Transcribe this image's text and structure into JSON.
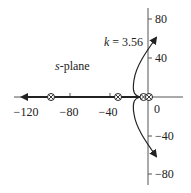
{
  "diagram": {
    "type": "root-locus",
    "plane_label_italic": "s",
    "plane_label_rest": "-plane",
    "gain_annotation_var": "k",
    "gain_annotation_rest": " = 3.56",
    "x_ticks": [
      {
        "value": -120,
        "label": "−120"
      },
      {
        "value": -80,
        "label": "−80"
      },
      {
        "value": -40,
        "label": "−40"
      },
      {
        "value": 0,
        "label": "0"
      }
    ],
    "y_ticks": [
      {
        "value": 80,
        "label": "80"
      },
      {
        "value": 40,
        "label": "40"
      },
      {
        "value": -40,
        "label": "−40"
      },
      {
        "value": -80,
        "label": "−80"
      }
    ],
    "markers": [
      {
        "type": "pole-zero",
        "symbol": "⊗",
        "real": -100
      },
      {
        "type": "pole-zero",
        "symbol": "⊗",
        "real": -30
      },
      {
        "type": "pole-zero",
        "symbol": "⊗",
        "real": -4
      },
      {
        "type": "pole-zero",
        "symbol": "⊗",
        "real": 0
      }
    ],
    "colors": {
      "line": "#222222",
      "background": "#ffffff"
    }
  }
}
